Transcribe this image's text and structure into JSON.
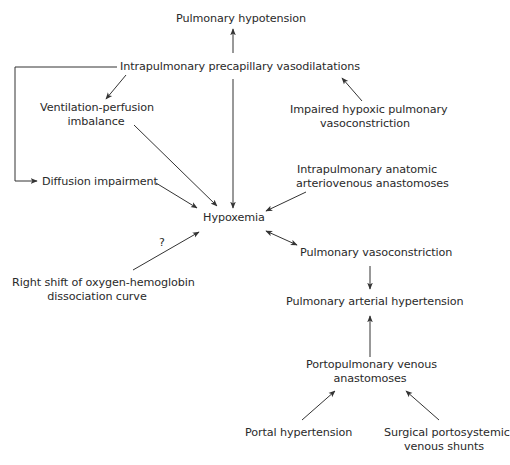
{
  "diagram": {
    "nodes": {
      "pulmonary_hypotension": "Pulmonary hypotension",
      "intrapulmonary_vasodilatations": "Intrapulmonary precapillary vasodilatations",
      "vq_line1": "Ventilation-perfusion",
      "vq_line2": "imbalance",
      "impaired_line1": "Impaired hypoxic pulmonary",
      "impaired_line2": "vasoconstriction",
      "diffusion": "Diffusion impairment",
      "anatomic_line1": "Intrapulmonary anatomic",
      "anatomic_line2": "arteriovenous anastomoses",
      "hypoxemia": "Hypoxemia",
      "right_shift_line1": "Right shift of oxygen-hemoglobin",
      "right_shift_line2": "dissociation curve",
      "question_mark": "?",
      "pulmonary_vasoconstriction": "Pulmonary vasoconstriction",
      "pah": "Pulmonary arterial hypertension",
      "portopulmonary_line1": "Portopulmonary venous",
      "portopulmonary_line2": "anastomoses",
      "portal_hypertension": "Portal hypertension",
      "surgical_line1": "Surgical portosystemic",
      "surgical_line2": "venous shunts"
    },
    "edges": [
      {
        "from": "Intrapulmonary precapillary vasodilatations",
        "to": "Pulmonary hypotension"
      },
      {
        "from": "Intrapulmonary precapillary vasodilatations",
        "to": "Ventilation-perfusion imbalance"
      },
      {
        "from": "Intrapulmonary precapillary vasodilatations",
        "to": "Diffusion impairment"
      },
      {
        "from": "Intrapulmonary precapillary vasodilatations",
        "to": "Hypoxemia"
      },
      {
        "from": "Impaired hypoxic pulmonary vasoconstriction",
        "to": "Intrapulmonary precapillary vasodilatations"
      },
      {
        "from": "Ventilation-perfusion imbalance",
        "to": "Hypoxemia"
      },
      {
        "from": "Diffusion impairment",
        "to": "Hypoxemia"
      },
      {
        "from": "Intrapulmonary anatomic arteriovenous anastomoses",
        "to": "Hypoxemia"
      },
      {
        "from": "Right shift of oxygen-hemoglobin dissociation curve",
        "to": "Hypoxemia",
        "label": "?"
      },
      {
        "from": "Hypoxemia",
        "to": "Pulmonary vasoconstriction",
        "bidirectional": true
      },
      {
        "from": "Pulmonary vasoconstriction",
        "to": "Pulmonary arterial hypertension"
      },
      {
        "from": "Portopulmonary venous anastomoses",
        "to": "Pulmonary arterial hypertension"
      },
      {
        "from": "Portal hypertension",
        "to": "Portopulmonary venous anastomoses"
      },
      {
        "from": "Surgical portosystemic venous shunts",
        "to": "Portopulmonary venous anastomoses"
      }
    ],
    "colors": {
      "line": "#333333",
      "text": "#2a2a2a",
      "background": "#ffffff"
    }
  }
}
